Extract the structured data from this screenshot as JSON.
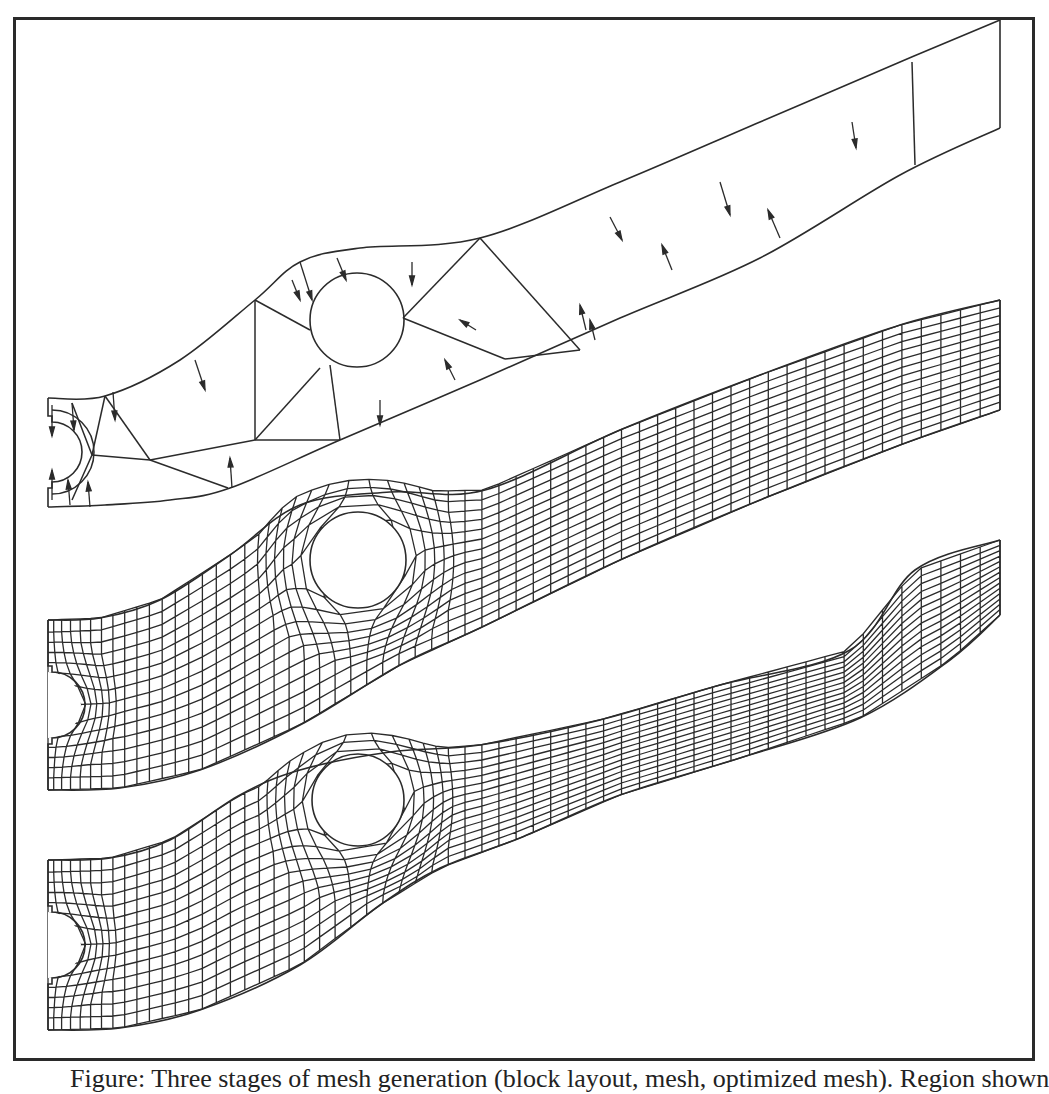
{
  "figure": {
    "colors": {
      "line": "#2b2b2b",
      "frame": "#2a2a2a",
      "background": "#ffffff"
    },
    "frame": {
      "left": 13,
      "top": 17,
      "right": 1035,
      "bottom": 1061
    },
    "panels": [
      {
        "name": "block-decomposition",
        "description": "Coarse block decomposition with boundary direction arrows",
        "left_x": 48,
        "right_x": 1000,
        "top_edge": [
          [
            48,
            398
          ],
          [
            105,
            396
          ],
          [
            180,
            360
          ],
          [
            255,
            300
          ],
          [
            300,
            262
          ],
          [
            360,
            248
          ],
          [
            480,
            238
          ],
          [
            620,
            182
          ],
          [
            760,
            122
          ],
          [
            900,
            62
          ],
          [
            1000,
            20
          ]
        ],
        "bottom_edge": [
          [
            48,
            507
          ],
          [
            105,
            505
          ],
          [
            170,
            500
          ],
          [
            230,
            488
          ],
          [
            340,
            440
          ],
          [
            480,
            380
          ],
          [
            620,
            318
          ],
          [
            760,
            258
          ],
          [
            900,
            175
          ],
          [
            1000,
            128
          ]
        ],
        "notch": {
          "cx": 48,
          "cy": 452,
          "r": 30
        },
        "hole": {
          "cx": 357,
          "cy": 320,
          "r": 47
        },
        "block_lines": [
          [
            [
              72,
              403
            ],
            [
              92,
              455
            ],
            [
              72,
              500
            ]
          ],
          [
            [
              105,
              396
            ],
            [
              92,
              455
            ]
          ],
          [
            [
              92,
              455
            ],
            [
              150,
              460
            ]
          ],
          [
            [
              150,
              460
            ],
            [
              228,
              488
            ]
          ],
          [
            [
              105,
              396
            ],
            [
              150,
              460
            ]
          ],
          [
            [
              150,
              460
            ],
            [
              255,
              440
            ]
          ],
          [
            [
              255,
              300
            ],
            [
              255,
              440
            ]
          ],
          [
            [
              255,
              440
            ],
            [
              340,
              440
            ]
          ],
          [
            [
              255,
              300
            ],
            [
              310,
              330
            ]
          ],
          [
            [
              255,
              440
            ],
            [
              320,
              368
            ]
          ],
          [
            [
              340,
              440
            ],
            [
              330,
              365
            ]
          ],
          [
            [
              480,
              238
            ],
            [
              403,
              318
            ]
          ],
          [
            [
              403,
              318
            ],
            [
              505,
              359
            ]
          ],
          [
            [
              480,
              238
            ],
            [
              580,
              350
            ]
          ],
          [
            [
              580,
              350
            ],
            [
              505,
              359
            ]
          ],
          [
            [
              912,
              62
            ],
            [
              915,
              165
            ]
          ]
        ],
        "arrows": [
          [
            [
              113,
              392
            ],
            [
              115,
              420
            ]
          ],
          [
            [
              72,
              403
            ],
            [
              74,
              430
            ]
          ],
          [
            [
              52,
              405
            ],
            [
              52,
              436
            ]
          ],
          [
            [
              52,
              500
            ],
            [
              52,
              470
            ]
          ],
          [
            [
              90,
              507
            ],
            [
              88,
              482
            ]
          ],
          [
            [
              70,
              505
            ],
            [
              68,
              480
            ]
          ],
          [
            [
              300,
              262
            ],
            [
              312,
              300
            ]
          ],
          [
            [
              195,
              360
            ],
            [
              205,
              390
            ]
          ],
          [
            [
              337,
              258
            ],
            [
              346,
              280
            ]
          ],
          [
            [
              412,
              262
            ],
            [
              412,
              285
            ]
          ],
          [
            [
              232,
              488
            ],
            [
              230,
              458
            ]
          ],
          [
            [
              380,
              400
            ],
            [
              380,
              425
            ]
          ],
          [
            [
              292,
              280
            ],
            [
              300,
              300
            ]
          ],
          [
            [
              455,
              380
            ],
            [
              445,
              360
            ]
          ],
          [
            [
              476,
              330
            ],
            [
              460,
              320
            ]
          ],
          [
            [
              586,
              330
            ],
            [
              580,
              305
            ]
          ],
          [
            [
              595,
              340
            ],
            [
              590,
              320
            ]
          ],
          [
            [
              672,
              270
            ],
            [
              662,
              245
            ]
          ],
          [
            [
              610,
              217
            ],
            [
              622,
              240
            ]
          ],
          [
            [
              720,
              182
            ],
            [
              730,
              215
            ]
          ],
          [
            [
              780,
              238
            ],
            [
              768,
              210
            ]
          ],
          [
            [
              852,
              122
            ],
            [
              856,
              148
            ]
          ]
        ]
      },
      {
        "name": "initial-mesh",
        "description": "Fine structured quadrilateral mesh",
        "left_x": 48,
        "right_x": 1000,
        "top_edge": [
          [
            48,
            620
          ],
          [
            100,
            618
          ],
          [
            160,
            600
          ],
          [
            230,
            555
          ],
          [
            300,
            505
          ],
          [
            390,
            492
          ],
          [
            485,
            490
          ],
          [
            620,
            430
          ],
          [
            760,
            375
          ],
          [
            900,
            325
          ],
          [
            1000,
            300
          ]
        ],
        "bottom_edge": [
          [
            48,
            790
          ],
          [
            120,
            788
          ],
          [
            200,
            770
          ],
          [
            300,
            725
          ],
          [
            400,
            665
          ],
          [
            480,
            628
          ],
          [
            620,
            560
          ],
          [
            760,
            500
          ],
          [
            900,
            445
          ],
          [
            1000,
            410
          ]
        ],
        "notch": {
          "cx": 48,
          "cy": 705,
          "r": 33
        },
        "hole": {
          "cx": 358,
          "cy": 560,
          "r": 48
        },
        "mesh": {
          "columns": 60,
          "rows": 14,
          "right_columns": 16,
          "right_rows": 5
        }
      },
      {
        "name": "optimized-mesh",
        "description": "Deformed / optimized quadrilateral mesh",
        "left_x": 48,
        "right_x": 1000,
        "top_edge": [
          [
            48,
            860
          ],
          [
            110,
            858
          ],
          [
            170,
            840
          ],
          [
            240,
            795
          ],
          [
            300,
            770
          ],
          [
            390,
            752
          ],
          [
            480,
            745
          ],
          [
            600,
            720
          ],
          [
            720,
            685
          ],
          [
            850,
            650
          ],
          [
            915,
            570
          ],
          [
            1000,
            540
          ]
        ],
        "bottom_edge": [
          [
            48,
            1030
          ],
          [
            120,
            1028
          ],
          [
            200,
            1010
          ],
          [
            300,
            965
          ],
          [
            380,
            905
          ],
          [
            440,
            868
          ],
          [
            520,
            838
          ],
          [
            620,
            795
          ],
          [
            740,
            758
          ],
          [
            860,
            718
          ],
          [
            950,
            660
          ],
          [
            1000,
            615
          ]
        ],
        "notch": {
          "cx": 48,
          "cy": 945,
          "r": 33
        },
        "hole": {
          "cx": 358,
          "cy": 800,
          "r": 46
        },
        "mesh": {
          "columns": 60,
          "rows": 14,
          "right_columns": 9,
          "right_rows": 5
        }
      }
    ]
  },
  "caption": {
    "text": "Figure: Three stages of mesh generation (block layout, mesh, optimized mesh). Region shown"
  }
}
